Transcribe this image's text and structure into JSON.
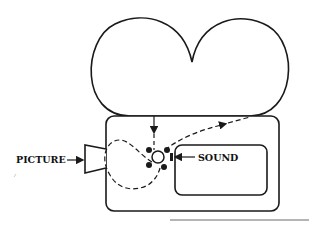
{
  "diagram": {
    "labels": {
      "picture": "PICTURE",
      "sound": "SOUND"
    },
    "colors": {
      "stroke": "#1a1a1a",
      "background": "#ffffff"
    },
    "components": [
      {
        "name": "supply-reel",
        "shape": "circle"
      },
      {
        "name": "takeup-reel",
        "shape": "circle"
      },
      {
        "name": "camera-body",
        "shape": "rounded-rectangle"
      },
      {
        "name": "lens",
        "shape": "trapezoid"
      },
      {
        "name": "sound-panel",
        "shape": "rounded-rectangle"
      },
      {
        "name": "sprocket",
        "shape": "circle-with-teeth"
      },
      {
        "name": "film-path",
        "shape": "dashed-curve"
      }
    ]
  }
}
